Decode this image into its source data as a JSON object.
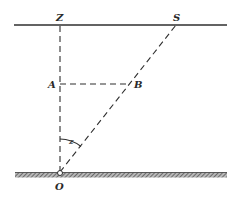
{
  "diagram": {
    "title": "",
    "labels": {
      "Z": "Z",
      "S": "S",
      "A": "A",
      "B": "B",
      "O": "O",
      "angle": "z"
    },
    "colors": {
      "line": "#2f2f2f",
      "ground_hatch": "#6a6a6a",
      "background": "#ffffff"
    },
    "elements": [
      {
        "id": "top-horizontal-line",
        "type": "solid-line",
        "from": [
          14,
          25
        ],
        "to": [
          227,
          25
        ]
      },
      {
        "id": "vertical-OZ",
        "type": "dashed-line",
        "from": [
          60,
          173
        ],
        "to": [
          60,
          25
        ]
      },
      {
        "id": "slant-OS",
        "type": "dashed-line",
        "from": [
          60,
          173
        ],
        "to": [
          176,
          25
        ]
      },
      {
        "id": "horizontal-AB",
        "type": "dashed-line",
        "from": [
          60,
          84
        ],
        "to": [
          130,
          84
        ]
      },
      {
        "id": "angle-arc-z",
        "type": "arc",
        "center": [
          60,
          173
        ],
        "radius": 34
      },
      {
        "id": "ground",
        "type": "hatched-line",
        "from": [
          15,
          175
        ],
        "to": [
          227,
          175
        ]
      },
      {
        "id": "point-O",
        "type": "circle",
        "center": [
          60,
          173
        ],
        "radius": 2.5
      }
    ]
  }
}
